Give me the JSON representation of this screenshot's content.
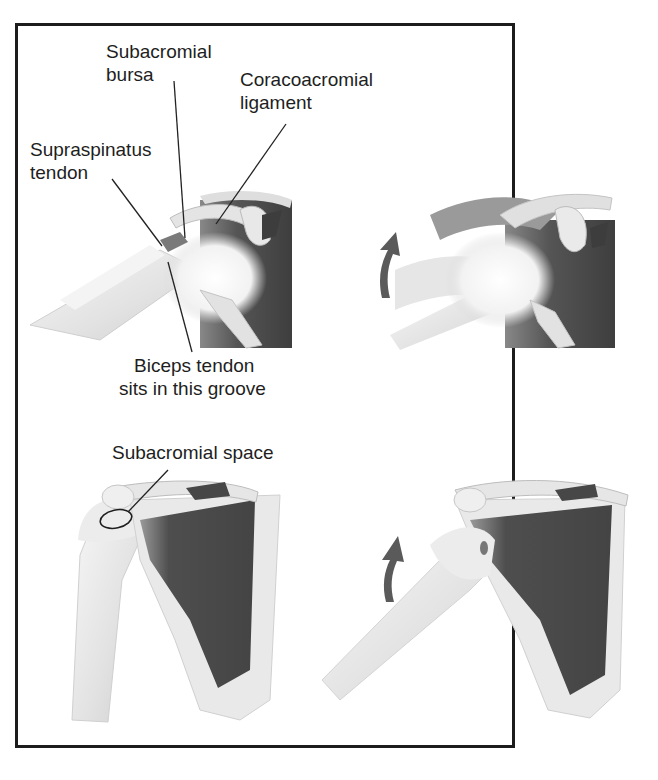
{
  "figure": {
    "panels": [
      {
        "id": "top-left",
        "view": "side view, arm at rest"
      },
      {
        "id": "top-right",
        "view": "side view, arm raised",
        "arrow": "upward-rotation-arrow"
      },
      {
        "id": "bottom-left",
        "view": "front view, arm at rest"
      },
      {
        "id": "bottom-right",
        "view": "front view, arm raised",
        "arrow": "upward-rotation-arrow"
      }
    ],
    "labels": {
      "subacromial_bursa_line1": "Subacromial",
      "subacromial_bursa_line2": "bursa",
      "coracoacromial_line1": "Coracoacromial",
      "coracoacromial_line2": "ligament",
      "supraspinatus_line1": "Supraspinatus",
      "supraspinatus_line2": "tendon",
      "biceps_line1": "Biceps tendon",
      "biceps_line2": "sits in this groove",
      "subacromial_space": "Subacromial space"
    },
    "colors": {
      "muscle": "#4a4a4a",
      "bone": "#ececec",
      "arrow": "#5a5a5a",
      "border": "#1c1c1c"
    }
  }
}
